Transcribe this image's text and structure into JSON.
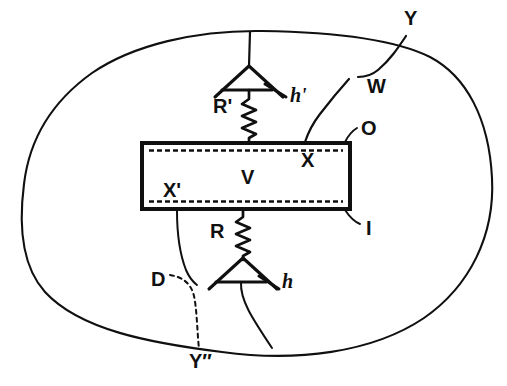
{
  "figure": {
    "background_color": "#ffffff",
    "ink_color": "#101010",
    "width": 507,
    "height": 386
  },
  "labels": {
    "outer_boundary_top_right": "Y",
    "feedback_node": "W",
    "output_terminal": "O",
    "input_terminal": "I",
    "box_interior": "V",
    "box_top_right_inner": "X",
    "box_bottom_left_inner": "X'",
    "upper_resistor": "R'",
    "lower_resistor": "R",
    "upper_gain": "h'",
    "lower_gain": "h",
    "dashed_node": "D",
    "outer_boundary_bottom": "Y″"
  },
  "shapes": {
    "enclosure": {
      "name": "outer-blob-outline",
      "type": "closed-curve",
      "stroke": "#101010",
      "stroke_width": 2.1
    },
    "center_box": {
      "name": "transmission-line-box",
      "type": "rectangle",
      "x": 140,
      "y": 141,
      "width": 212,
      "height": 70,
      "stroke": "#101010",
      "stroke_width": 4,
      "fill": "#ffffff",
      "inner_dashed_lines": 2
    },
    "upper_amplifier": {
      "name": "upper-triangle-amplifier",
      "type": "triangle-up-with-bar",
      "apex_x": 249,
      "apex_y": 66,
      "base_y": 95,
      "half_width": 34
    },
    "lower_amplifier": {
      "name": "lower-triangle-amplifier",
      "type": "triangle-up-with-bar",
      "apex_x": 243,
      "apex_y": 258,
      "base_y": 286,
      "half_width": 34
    },
    "upper_resistor_zigzag": {
      "name": "upper-resistor-zigzag",
      "x": 249,
      "y_top": 97,
      "y_bottom": 141,
      "amplitude": 7,
      "peaks": 7
    },
    "lower_resistor_zigzag": {
      "name": "lower-resistor-zigzag",
      "x": 243,
      "y_top": 212,
      "y_bottom": 258,
      "amplitude": 7,
      "peaks": 7
    }
  },
  "label_positions": {
    "Y": {
      "x": 404,
      "y": 8,
      "size": 19
    },
    "W": {
      "x": 367,
      "y": 76,
      "size": 19
    },
    "O": {
      "x": 361,
      "y": 119,
      "size": 19
    },
    "I": {
      "x": 364,
      "y": 219,
      "size": 19
    },
    "V": {
      "x": 241,
      "y": 168,
      "size": 19
    },
    "X": {
      "x": 302,
      "y": 150,
      "size": 19
    },
    "X'": {
      "x": 163,
      "y": 180,
      "size": 19
    },
    "R'": {
      "x": 215,
      "y": 97,
      "size": 19
    },
    "R": {
      "x": 211,
      "y": 222,
      "size": 19
    },
    "h'": {
      "x": 290,
      "y": 87,
      "size": 19
    },
    "h": {
      "x": 281,
      "y": 272,
      "size": 19
    },
    "D": {
      "x": 152,
      "y": 270,
      "size": 19
    },
    "Y2": {
      "x": 190,
      "y": 352,
      "size": 19
    }
  }
}
